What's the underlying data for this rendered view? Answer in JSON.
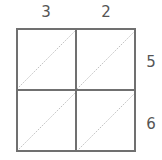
{
  "diagram": {
    "type": "lattice-multiplication-grid",
    "top_digits": [
      "3",
      "2"
    ],
    "right_digits": [
      "5",
      "6"
    ],
    "rows": 2,
    "cols": 2,
    "colors": {
      "border": "#707070",
      "diagonal": "#b0b0b0",
      "text": "#555555"
    }
  }
}
